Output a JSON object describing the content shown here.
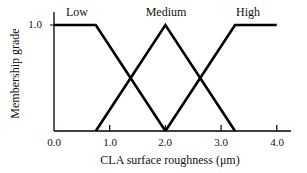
{
  "chart_data": {
    "type": "line",
    "title": "",
    "xlabel": "CLA surface roughness (μm)",
    "ylabel": "Membership grade",
    "xlim": [
      0.0,
      4.2
    ],
    "ylim": [
      0.0,
      1.0
    ],
    "x_ticks": [
      "0.0",
      "1.0",
      "2.0",
      "3.0",
      "4.0"
    ],
    "y_ticks": [
      "1.0"
    ],
    "grid": false,
    "legend": "inline labels above each curve",
    "series": [
      {
        "name": "Low",
        "x": [
          0.0,
          0.75,
          2.0
        ],
        "y": [
          1.0,
          1.0,
          0.0
        ]
      },
      {
        "name": "Medium",
        "x": [
          0.75,
          2.0,
          3.25
        ],
        "y": [
          0.0,
          1.0,
          0.0
        ]
      },
      {
        "name": "High",
        "x": [
          2.0,
          3.25,
          4.0
        ],
        "y": [
          0.0,
          1.0,
          1.0
        ]
      }
    ]
  },
  "labels": {
    "low": "Low",
    "medium": "Medium",
    "high": "High",
    "xlabel": "CLA surface roughness (μm)",
    "ylabel": "Membership grade",
    "xt0": "0.0",
    "xt1": "1.0",
    "xt2": "2.0",
    "xt3": "3.0",
    "xt4": "4.0",
    "yt1": "1.0"
  }
}
